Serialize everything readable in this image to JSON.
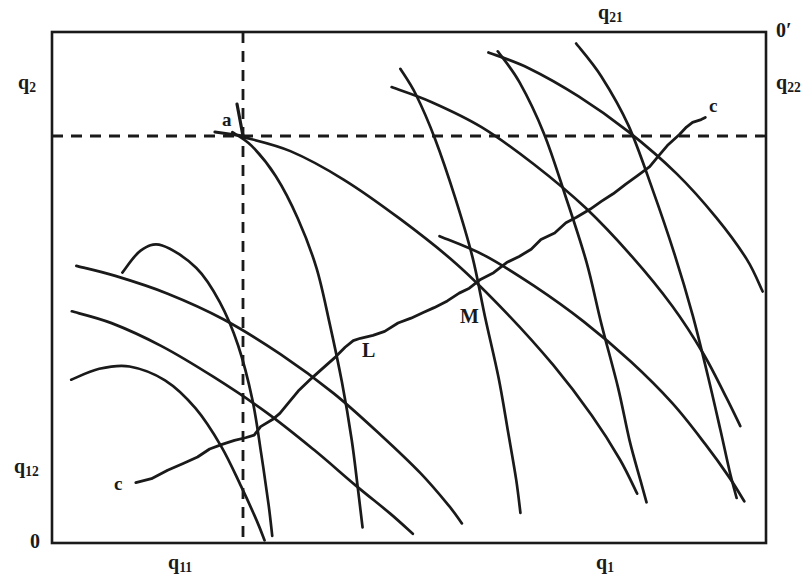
{
  "figure": {
    "type": "edgeworth-box-diagram",
    "width": 809,
    "height": 577,
    "background_color": "#ffffff",
    "ink_color": "#1a1a1a"
  },
  "labels": {
    "y_axis_left_top": "q2",
    "y_axis_left_top_sub": "2",
    "y_axis_left_bottom": "q12",
    "y_axis_left_bottom_sub": "12",
    "origin_left": "0",
    "x_axis_bottom_left": "q11",
    "x_axis_bottom_left_sub": "11",
    "x_axis_bottom_right": "q1",
    "x_axis_bottom_right_sub": "1",
    "x_axis_top": "q21",
    "x_axis_top_sub": "21",
    "origin_right": "0′",
    "y_axis_right": "q22",
    "y_axis_right_sub": "22",
    "point_a": "a",
    "point_L": "L",
    "point_M": "M",
    "contract_curve_start": "c",
    "contract_curve_end": "c"
  },
  "chart_data": {
    "type": "line",
    "title": "",
    "xlabel": "q1",
    "ylabel": "q2",
    "grid": false,
    "legend": "none",
    "box": {
      "x0": 52,
      "y0": 32,
      "x1": 766,
      "y1": 543
    },
    "dashed_lines": [
      {
        "name": "vertical-endowment-line",
        "orientation": "vertical",
        "x": 243,
        "y_from": 32,
        "y_to": 543
      },
      {
        "name": "horizontal-endowment-line",
        "orientation": "horizontal",
        "y": 136,
        "x_from": 52,
        "x_to": 766
      }
    ],
    "points": [
      {
        "label": "a",
        "x": 243,
        "y": 136,
        "note": "endowment point at intersection of dashed lines"
      },
      {
        "label": "L",
        "x": 352,
        "y": 340,
        "note": "tangency on contract curve"
      },
      {
        "label": "M",
        "x": 472,
        "y": 294,
        "note": "tangency on contract curve"
      }
    ],
    "series": [
      {
        "name": "agent1-indifference-curve-1",
        "group": "agent1",
        "points": "122,272 140,250 163,246 196,268 220,302 238,345 252,400 262,455 268,505 272,536"
      },
      {
        "name": "agent1-indifference-curve-2",
        "group": "agent1",
        "points": "72,380 100,368 130,366 165,380 196,408 222,447 242,487 256,520 264,540"
      },
      {
        "name": "agent1-indifference-curve-3",
        "group": "agent1",
        "points": "232,132 252,146 276,176 298,218 316,268 330,322 342,382 352,440 358,490 362,528"
      },
      {
        "name": "agent1-indifference-curve-4",
        "group": "agent1",
        "points": "400,68 416,94 436,140 456,198 472,258 486,318 498,378 508,432 516,480 520,512"
      },
      {
        "name": "agent1-indifference-curve-5",
        "group": "agent1",
        "points": "498,52 520,82 544,134 566,196 586,262 602,324 618,388 630,440 640,480 646,502"
      },
      {
        "name": "agent1-indifference-curve-6",
        "group": "agent1",
        "points": "576,44 602,76 628,126 652,188 674,254 692,316 708,378 720,430 730,472 736,498"
      },
      {
        "name": "agent2-indifference-curve-1",
        "group": "agent2",
        "points": "72,312 112,324 162,346 214,376 266,412 314,450 356,486 390,514 412,534"
      },
      {
        "name": "agent2-indifference-curve-2",
        "group": "agent2",
        "points": "76,266 116,276 168,294 224,320 280,354 334,394 382,436 420,474 448,506 462,524"
      },
      {
        "name": "agent2-indifference-curve-3",
        "group": "agent2",
        "points": "243,136 290,152 344,180 400,218 456,264 508,314 554,366 592,416 620,460 638,494"
      },
      {
        "name": "agent2-indifference-curve-4",
        "group": "agent2",
        "points": "392,88 432,102 482,128 534,164 586,208 632,256 672,306 704,354 726,396 740,426"
      },
      {
        "name": "agent2-indifference-curve-5",
        "group": "agent2",
        "points": "440,236 484,256 534,286 584,322 630,362 672,404 706,444 730,478 744,502"
      },
      {
        "name": "agent2-indifference-curve-6",
        "group": "agent2",
        "points": "488,52 528,68 578,96 628,132 676,174 716,218 746,260 762,292"
      }
    ],
    "contract_curve": {
      "name": "contract-curve",
      "from_label": "c",
      "to_label": "c",
      "points": "135,484 152,478 168,470 182,462 196,456 210,450 222,446 234,442 244,438 254,434 262,428 272,420 280,412 290,402 300,392 312,380 322,368 334,356 344,348 352,342 362,338 374,334 386,330 398,324 410,318 422,312 434,306 446,300 458,294 470,288 482,280 494,272 506,264 518,256 530,248 542,240 554,232 566,224 578,216 590,208 602,200 614,192 626,184 638,176 648,166 658,156 668,146 678,136 686,128 694,122 700,119 706,117"
    }
  }
}
